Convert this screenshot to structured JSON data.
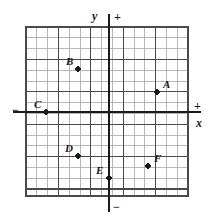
{
  "figure": {
    "type": "scatter-on-grid",
    "background": "#ffffff",
    "ink_color": "#1a1a1a",
    "grid_minor_color": "#9a9a9a",
    "grid_major_color": "#4a4a4a",
    "axis_color": "#1a1a1a"
  },
  "grid": {
    "left_px": 26,
    "top_px": 27,
    "right_px": 188,
    "bottom_px": 196,
    "cell_px": 10.8,
    "columns": 15,
    "rows": 15,
    "major_every": 3,
    "origin_px": {
      "x": 109,
      "y": 112
    },
    "origin_cell": {
      "col": 7.7,
      "row": 7.9
    }
  },
  "axes": {
    "x_axis": {
      "label": "x",
      "positive_sign": "+",
      "negative_sign": "−",
      "label_x_px": 196,
      "label_y_px": 117,
      "plus_x_px": 194,
      "plus_y_px": 100,
      "minus_x_px": 12,
      "minus_y_px": 104,
      "line_y_px": 112,
      "line_x0_px": 13,
      "line_x1_px": 201
    },
    "y_axis": {
      "label": "y",
      "positive_sign": "+",
      "negative_sign": "−",
      "label_x_px": 92,
      "label_y_px": 10,
      "plus_x_px": 114,
      "plus_y_px": 11,
      "minus_x_px": 113,
      "minus_y_px": 201,
      "line_x_px": 109,
      "line_y0_px": 14,
      "line_y1_px": 212
    }
  },
  "points": [
    {
      "id": "A",
      "label": "A",
      "dot_x_px": 157,
      "dot_y_px": 92,
      "label_x_px": 163,
      "label_y_px": 79,
      "label_pos": "upper-right",
      "coord": [
        4,
        2
      ]
    },
    {
      "id": "B",
      "label": "B",
      "dot_x_px": 78,
      "dot_y_px": 69,
      "label_x_px": 66,
      "label_y_px": 56,
      "label_pos": "upper-left",
      "coord": [
        -3,
        4
      ]
    },
    {
      "id": "C",
      "label": "C",
      "dot_x_px": 46,
      "dot_y_px": 112,
      "label_x_px": 34,
      "label_y_px": 99,
      "label_pos": "upper-left",
      "coord": [
        -6,
        0
      ]
    },
    {
      "id": "D",
      "label": "D",
      "dot_x_px": 78,
      "dot_y_px": 156,
      "label_x_px": 65,
      "label_y_px": 143,
      "label_pos": "upper-left",
      "coord": [
        -3,
        -4
      ]
    },
    {
      "id": "E",
      "label": "E",
      "dot_x_px": 109,
      "dot_y_px": 178,
      "label_x_px": 96,
      "label_y_px": 165,
      "label_pos": "upper-left",
      "coord": [
        0,
        -6
      ]
    },
    {
      "id": "F",
      "label": "F",
      "dot_x_px": 148,
      "dot_y_px": 166,
      "label_x_px": 154,
      "label_y_px": 153,
      "label_pos": "upper-right",
      "coord": [
        3,
        -5
      ]
    }
  ],
  "chart_data": {
    "type": "scatter",
    "title": "",
    "xlabel": "x",
    "ylabel": "y",
    "grid": true,
    "legend": "none",
    "xlim": [
      -7.7,
      7.3
    ],
    "ylim": [
      -7.1,
      7.9
    ],
    "point_labels": [
      "A",
      "B",
      "C",
      "D",
      "E",
      "F"
    ],
    "x": [
      4,
      -3,
      -6,
      -3,
      0,
      3
    ],
    "y": [
      2,
      4,
      0,
      -4,
      -6,
      -5
    ]
  }
}
